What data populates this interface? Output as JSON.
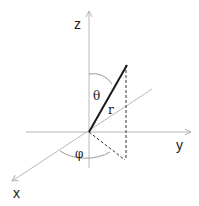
{
  "diagram": {
    "title": "",
    "axes": {
      "z": {
        "label": "z"
      },
      "y": {
        "label": "y"
      },
      "x": {
        "label": "x"
      }
    },
    "vector": {
      "label": "r"
    },
    "angles": {
      "polar": {
        "label": "θ"
      },
      "azimuth": {
        "label": "φ"
      }
    },
    "colors": {
      "axis": "#b0b0b0",
      "vector": "#1a1a1a",
      "dashed": "#333333",
      "arc": "#9a9a9a",
      "text": "#222222"
    }
  }
}
